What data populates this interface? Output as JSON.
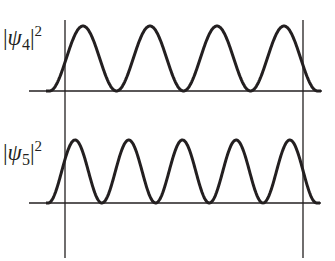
{
  "diagram": {
    "colors": {
      "curve": "#231f20",
      "axes": "#231f20",
      "background": "#ffffff"
    },
    "walls": {
      "left_x": 65,
      "right_x": 303,
      "top_y": 20,
      "bottom_y": 258
    },
    "panels": [
      {
        "label_bar": "|",
        "label_symbol": "ψ",
        "label_sub": "4",
        "label_close": "|",
        "label_sup": "2",
        "n_peaks": 4,
        "baseline_y": 91,
        "baseline_x_start": 29,
        "baseline_x_end": 322,
        "peak_y": 26,
        "first_trough_x": 49.5,
        "period": 67,
        "curve_x_start": 46,
        "curve_x_end": 321
      },
      {
        "label_bar": "|",
        "label_symbol": "ψ",
        "label_sub": "5",
        "label_close": "|",
        "label_sup": "2",
        "n_peaks": 5,
        "baseline_y": 203,
        "baseline_x_start": 29,
        "baseline_x_end": 321,
        "peak_y": 140,
        "first_trough_x": 48.2,
        "period": 53.7,
        "curve_x_start": 46,
        "curve_x_end": 320
      }
    ]
  }
}
